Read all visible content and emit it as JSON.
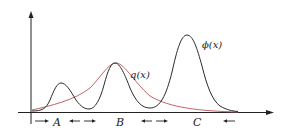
{
  "diagram": {
    "curves": {
      "phi": {
        "label": "ϕ(x)",
        "color": "#2a2a2a"
      },
      "q": {
        "label": "q(x)",
        "color": "#c0666b"
      }
    },
    "regions": [
      {
        "label": "A"
      },
      {
        "label": "B"
      },
      {
        "label": "C"
      }
    ],
    "arrows": [
      {
        "text": "→"
      },
      {
        "text": "←  →"
      },
      {
        "text": "←  →"
      },
      {
        "text": "←"
      }
    ],
    "axes": {
      "x_arrow": true,
      "y_arrow": true
    }
  }
}
